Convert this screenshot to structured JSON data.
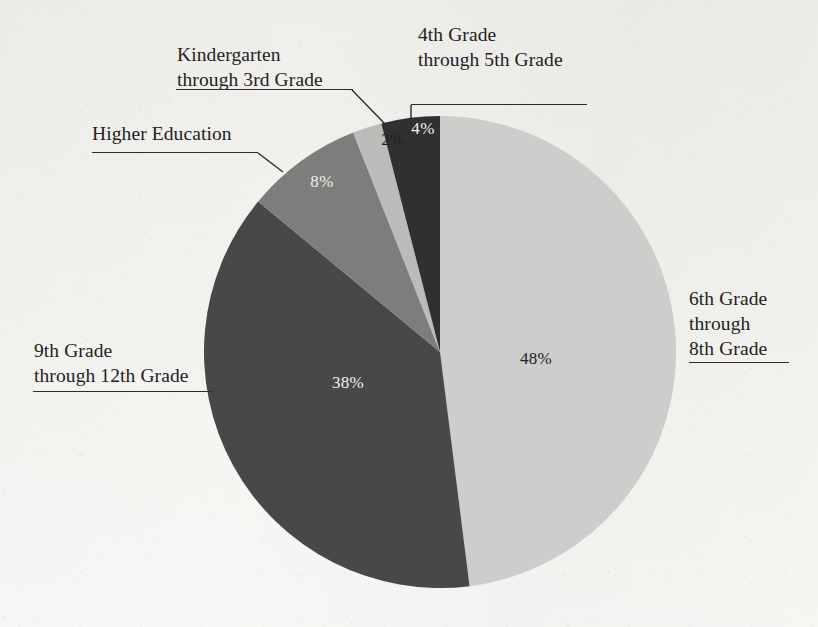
{
  "chart_data": {
    "type": "pie",
    "title": "",
    "subtitle": "",
    "xlabel": "",
    "ylabel": "",
    "legend_position": "callout-labels",
    "grid": false,
    "start_angle_deg": 0,
    "direction": "clockwise",
    "categories": [
      "6th Grade through 8th Grade",
      "9th Grade through 12th Grade",
      "Higher Education",
      "Kindergarten through 3rd Grade",
      "4th Grade through 5th Grade"
    ],
    "values": [
      48,
      38,
      8,
      2,
      4
    ],
    "value_labels": [
      "48%",
      "38%",
      "8%",
      "2%",
      "4%"
    ],
    "colors": [
      "#cdcdcb",
      "#484848",
      "#7d7d7b",
      "#bbbbb9",
      "#303030"
    ],
    "label_text_colors": [
      "#232323",
      "#f0efec",
      "#f0efec",
      "#232323",
      "#f0efec"
    ],
    "units": "percent"
  },
  "pie": {
    "center_x": 440,
    "center_y": 352,
    "radius": 236,
    "slices": [
      {
        "id": "slice-6th-8th",
        "name": "6th Grade through 8th Grade",
        "percent": 48,
        "label": "48%",
        "color": "#cdcdcb",
        "label_color": "#232323",
        "label_x": 536,
        "label_y": 364
      },
      {
        "id": "slice-9th-12th",
        "name": "9th Grade through 12th Grade",
        "percent": 38,
        "label": "38%",
        "color": "#484848",
        "label_color": "#f0efec",
        "label_x": 348,
        "label_y": 388
      },
      {
        "id": "slice-higher-education",
        "name": "Higher Education",
        "percent": 8,
        "label": "8%",
        "color": "#7d7d7b",
        "label_color": "#f0efec",
        "label_x": 322,
        "label_y": 187
      },
      {
        "id": "slice-kindergarten-3rd",
        "name": "Kindergarten through 3rd Grade",
        "percent": 2,
        "label": "2%",
        "color": "#bbbbb9",
        "label_color": "#232323",
        "label_x": 393,
        "label_y": 145
      },
      {
        "id": "slice-4th-5th",
        "name": "4th Grade through 5th Grade",
        "percent": 4,
        "label": "4%",
        "color": "#303030",
        "label_color": "#f0efec",
        "label_x": 423,
        "label_y": 134
      }
    ]
  },
  "callouts": {
    "fourth_fifth": {
      "line1": "4th Grade",
      "line2": "through 5th Grade"
    },
    "kindergarten_third": {
      "line1": "Kindergarten",
      "line2": "through 3rd Grade"
    },
    "higher_education": {
      "line1": "Higher Education"
    },
    "ninth_twelfth": {
      "line1": "9th Grade",
      "line2": "through 12th Grade"
    },
    "sixth_eighth": {
      "line1": "6th Grade",
      "line2": "through",
      "line3": "8th Grade"
    }
  }
}
